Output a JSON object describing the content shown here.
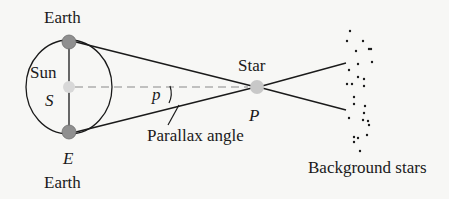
{
  "diagram": {
    "labels": {
      "earth_top": "Earth",
      "earth_bottom": "Earth",
      "sun": "Sun",
      "sun_symbol": "S",
      "earth_symbol": "E",
      "star": "Star",
      "star_symbol": "P",
      "angle_symbol": "p",
      "parallax_angle": "Parallax angle",
      "background_stars": "Background stars"
    },
    "colors": {
      "line": "#1a1a1a",
      "dashed_line": "#8a8a8a",
      "sun": "#d8d8d8",
      "earth": "#8f8f8f",
      "star": "#c8c8c8",
      "background": "#f7f7f5"
    }
  }
}
